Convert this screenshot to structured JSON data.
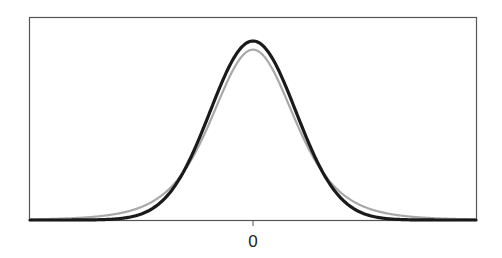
{
  "chart_data": {
    "type": "line",
    "title": "",
    "xlabel": "",
    "ylabel": "",
    "x_ticks": [
      0
    ],
    "x_tick_labels": [
      "0"
    ],
    "xlim": [
      -5.2,
      5.2
    ],
    "ylim": [
      0,
      0.4
    ],
    "grid": false,
    "legend": null,
    "series": [
      {
        "name": "t-distribution (heavier tails)",
        "kind": "student_t",
        "df": 5,
        "color": "#a8a8a8",
        "stroke_width": 2.2,
        "peak_density": 0.38,
        "sample_points": {
          "x": [
            -5,
            -4,
            -3,
            -2,
            -1,
            0,
            1,
            2,
            3,
            4,
            5
          ],
          "y": [
            0.0018,
            0.0051,
            0.0173,
            0.0651,
            0.2197,
            0.3796,
            0.2197,
            0.0651,
            0.0173,
            0.0051,
            0.0018
          ]
        }
      },
      {
        "name": "Normal distribution",
        "kind": "normal",
        "mean": 0,
        "sd": 1,
        "color": "#1a1a1a",
        "stroke_width": 3.2,
        "peak_density": 0.399,
        "sample_points": {
          "x": [
            -5,
            -4,
            -3,
            -2,
            -1,
            0,
            1,
            2,
            3,
            4,
            5
          ],
          "y": [
            1.5e-06,
            0.0001,
            0.0044,
            0.054,
            0.242,
            0.3989,
            0.242,
            0.054,
            0.0044,
            0.0001,
            1.5e-06
          ]
        }
      }
    ]
  },
  "axis": {
    "tick_label_zero": "0"
  }
}
